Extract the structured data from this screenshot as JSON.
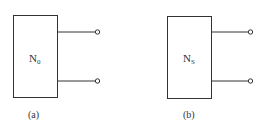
{
  "figures": [
    {
      "id": "a",
      "network_name": "N",
      "network_subscript": "0",
      "caption": "(a)"
    },
    {
      "id": "b",
      "network_name": "N",
      "network_subscript": "S",
      "caption": "(b)"
    }
  ],
  "colors": {
    "line": "#333333",
    "background": "#ffffff"
  }
}
